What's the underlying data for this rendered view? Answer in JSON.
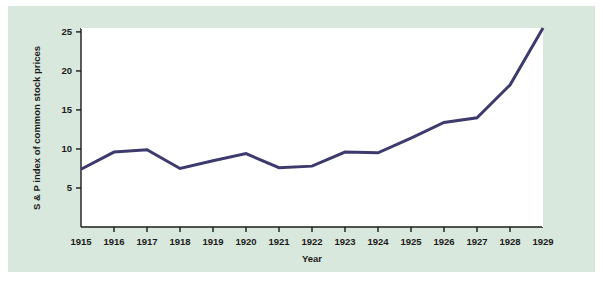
{
  "figure": {
    "background_color": "#ffffff",
    "panel_color": "#d9e8dc",
    "plot_background_color": "#ffffff",
    "axis_color": "#1b1b1b",
    "line_color": "#3d3a6e"
  },
  "chart_data": {
    "type": "line",
    "title": "",
    "xlabel": "Year",
    "ylabel": "S & P index of common stock prices",
    "categories": [
      "1915",
      "1916",
      "1917",
      "1918",
      "1919",
      "1920",
      "1921",
      "1922",
      "1923",
      "1924",
      "1925",
      "1926",
      "1927",
      "1928",
      "1929"
    ],
    "x": [
      1915,
      1916,
      1917,
      1918,
      1919,
      1920,
      1921,
      1922,
      1923,
      1924,
      1925,
      1926,
      1927,
      1928,
      1929
    ],
    "values": [
      7.4,
      9.6,
      9.9,
      7.5,
      8.5,
      9.4,
      7.6,
      7.8,
      9.6,
      9.5,
      11.4,
      13.4,
      14.0,
      18.2,
      25.5
    ],
    "series": [
      {
        "name": "S & P index of common stock prices",
        "values": [
          7.4,
          9.6,
          9.9,
          7.5,
          8.5,
          9.4,
          7.6,
          7.8,
          9.6,
          9.5,
          11.4,
          13.4,
          14.0,
          18.2,
          25.5
        ]
      }
    ],
    "xlim": [
      1915,
      1929
    ],
    "ylim": [
      0,
      25.5
    ],
    "ytick_values": [
      5,
      10,
      15,
      20,
      25
    ],
    "ytick_labels": [
      "5",
      "10",
      "15",
      "20",
      "25"
    ],
    "xtick_labels": [
      "1915",
      "1916",
      "1917",
      "1918",
      "1919",
      "1920",
      "1921",
      "1922",
      "1923",
      "1924",
      "1925",
      "1926",
      "1927",
      "1928",
      "1929"
    ],
    "grid": false,
    "legend": null,
    "legend_position": "none",
    "line_width": 3,
    "markers": false
  }
}
